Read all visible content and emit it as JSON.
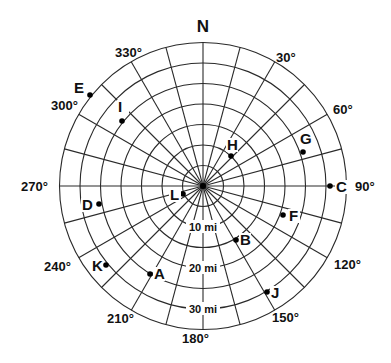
{
  "diagram": {
    "title": "N",
    "center": {
      "x": 203,
      "y": 186
    },
    "ring_spacing_px": 20.5,
    "ring_count": 7,
    "miles_per_ring": 5,
    "spoke_step_deg": 15,
    "degree_labels": [
      {
        "text": "30°",
        "x": 276,
        "y": 62
      },
      {
        "text": "60°",
        "x": 333,
        "y": 114
      },
      {
        "text": "90°",
        "x": 355,
        "y": 191
      },
      {
        "text": "120°",
        "x": 334,
        "y": 269
      },
      {
        "text": "150°",
        "x": 272,
        "y": 322
      },
      {
        "text": "180°",
        "x": 182,
        "y": 343
      },
      {
        "text": "210°",
        "x": 107,
        "y": 323
      },
      {
        "text": "240°",
        "x": 44,
        "y": 271
      },
      {
        "text": "270°",
        "x": 21,
        "y": 191
      },
      {
        "text": "300°",
        "x": 51,
        "y": 110
      },
      {
        "text": "330°",
        "x": 115,
        "y": 57
      }
    ],
    "distance_labels": [
      {
        "text": "10 mi",
        "miles": 10
      },
      {
        "text": "20 mi",
        "miles": 20
      },
      {
        "text": "30 mi",
        "miles": 30
      }
    ],
    "points": [
      {
        "label": "A",
        "bearing": 210,
        "miles": 25,
        "dot": [
          150,
          274
        ],
        "text_pos": [
          154,
          279
        ],
        "anchor": "start"
      },
      {
        "label": "B",
        "bearing": 150,
        "miles": 15,
        "dot": [
          236,
          240
        ],
        "text_pos": [
          240,
          245
        ],
        "anchor": "start"
      },
      {
        "label": "C",
        "bearing": 90,
        "miles": 30,
        "dot": [
          330,
          186
        ],
        "text_pos": [
          336,
          192
        ],
        "anchor": "start"
      },
      {
        "label": "D",
        "bearing": 255,
        "miles": 25,
        "dot": [
          99,
          204
        ],
        "text_pos": [
          82,
          210
        ],
        "anchor": "start"
      },
      {
        "label": "E",
        "bearing": 315,
        "miles": 35,
        "dot": [
          90,
          95
        ],
        "text_pos": [
          74,
          93
        ],
        "anchor": "start"
      },
      {
        "label": "F",
        "bearing": 105,
        "miles": 20,
        "dot": [
          283,
          215
        ],
        "text_pos": [
          289,
          221
        ],
        "anchor": "start"
      },
      {
        "label": "G",
        "bearing": 75,
        "miles": 25,
        "dot": [
          303,
          152
        ],
        "text_pos": [
          300,
          144
        ],
        "anchor": "start"
      },
      {
        "label": "H",
        "bearing": 45,
        "miles": 10,
        "dot": [
          231,
          156
        ],
        "text_pos": [
          227,
          150
        ],
        "anchor": "start"
      },
      {
        "label": "I",
        "bearing": 315,
        "miles": 25,
        "dot": [
          122,
          121
        ],
        "text_pos": [
          118,
          112
        ],
        "anchor": "start"
      },
      {
        "label": "J",
        "bearing": 150,
        "miles": 30,
        "dot": [
          267,
          292
        ],
        "text_pos": [
          271,
          298
        ],
        "anchor": "start"
      },
      {
        "label": "K",
        "bearing": 225,
        "miles": 30,
        "dot": [
          106,
          265
        ],
        "text_pos": [
          92,
          271
        ],
        "anchor": "start"
      },
      {
        "label": "L",
        "bearing": 255,
        "miles": 5,
        "dot": [
          183,
          194
        ],
        "text_pos": [
          170,
          200
        ],
        "anchor": "start"
      }
    ]
  }
}
